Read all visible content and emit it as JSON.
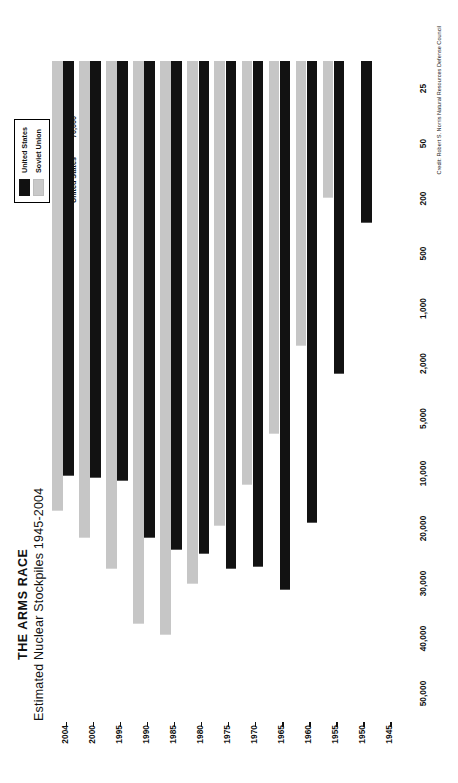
{
  "title": {
    "main": "THE ARMS RACE",
    "sub": "Estimated Nuclear Stockpiles 1945-2004"
  },
  "legend": {
    "items": [
      {
        "label": "United States",
        "color": "#121212",
        "swatch": "us"
      },
      {
        "label": "Soviet Union",
        "color": "#c6c6c6",
        "swatch": "su"
      }
    ],
    "totals_title": "Total Built",
    "totals": [
      {
        "name": "United States",
        "value": "70,000"
      },
      {
        "name": "Soviet Union",
        "value": "55,000"
      }
    ]
  },
  "credit": "Credit: Robert S. Norris Natural Resources Defense Council",
  "chart_data": {
    "type": "bar",
    "orientation": "horizontal",
    "title": "THE ARMS RACE",
    "subtitle": "Estimated Nuclear Stockpiles 1945-2004",
    "xlabel": "",
    "ylabel": "",
    "xscale": "log",
    "xticks": [
      "50,000",
      "40,000",
      "30,000",
      "20,000",
      "10,000",
      "5,000",
      "2,000",
      "1,000",
      "500",
      "200",
      "50",
      "25"
    ],
    "xtick_values": [
      50000,
      40000,
      30000,
      20000,
      10000,
      5000,
      2000,
      1000,
      500,
      200,
      50,
      25
    ],
    "xlim": [
      25,
      55000
    ],
    "grid": false,
    "legend_position": "top-right",
    "categories": [
      "1945",
      "1950",
      "1955",
      "1960",
      "1965",
      "1970",
      "1975",
      "1980",
      "1985",
      "1990",
      "1995",
      "2000",
      "2004"
    ],
    "series": [
      {
        "name": "United States",
        "color": "#121212",
        "values": [
          6,
          300,
          2400,
          18600,
          31100,
          26500,
          27000,
          24100,
          23400,
          21400,
          11000,
          10600,
          10300
        ]
      },
      {
        "name": "Soviet Union",
        "color": "#c6c6c6",
        "values": [
          0,
          25,
          200,
          1600,
          6100,
          11600,
          19400,
          30100,
          39200,
          37000,
          27000,
          21500,
          16000
        ]
      }
    ],
    "annotations": {
      "total_built_united_states": "70,000",
      "total_built_soviet_union": "55,000"
    }
  }
}
